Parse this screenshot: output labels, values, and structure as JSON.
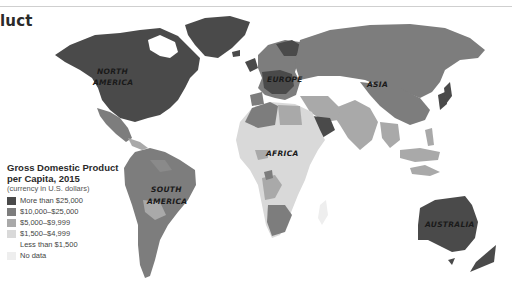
{
  "title": "luct",
  "legend": {
    "title_line1": "Gross Domestic Product",
    "title_line2": "per Capita, 2015",
    "subtitle": "(currency in U.S. dollars)",
    "items": [
      {
        "label": "More than $25,000",
        "color": "#4a4a4a"
      },
      {
        "label": "$10,000–$25,000",
        "color": "#7d7d7d"
      },
      {
        "label": "$5,000–$9,999",
        "color": "#a9a9a9"
      },
      {
        "label": "$1,500–$4,999",
        "color": "#d9d9d9"
      },
      {
        "label": "Less than $1,500",
        "color": "#ffffff"
      },
      {
        "label": "No data",
        "color": "#eeeeee"
      }
    ]
  },
  "regions": {
    "north_america_1": "NORTH",
    "north_america_2": "AMERICA",
    "south_america_1": "SOUTH",
    "south_america_2": "AMERICA",
    "europe": "EUROPE",
    "asia": "ASIA",
    "africa": "AFRICA",
    "australia": "AUSTRALIA"
  }
}
